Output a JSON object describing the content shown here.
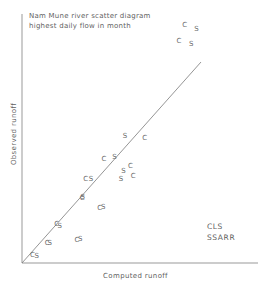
{
  "chart_data": {
    "type": "scatter",
    "title": "Nam Mune river scatter diagram",
    "subtitle": "highest daily flow in month",
    "xlabel": "Computed runoff",
    "ylabel": "Observed runoff",
    "grid": false,
    "xlim": [
      0,
      1
    ],
    "ylim": [
      0,
      1
    ],
    "axis_ticks": "none",
    "reference_line": {
      "label": "1:1 line",
      "from": [
        0,
        0
      ],
      "to": [
        0.74,
        0.84
      ]
    },
    "legend": {
      "position": "bottom-right",
      "entries": [
        "CLS",
        "SSARR"
      ]
    },
    "series": [
      {
        "name": "CLS",
        "marker_glyph": "C",
        "points": [
          [
            0.045,
            0.033
          ],
          [
            0.107,
            0.08
          ],
          [
            0.147,
            0.155
          ],
          [
            0.233,
            0.092
          ],
          [
            0.255,
            0.262
          ],
          [
            0.27,
            0.338
          ],
          [
            0.33,
            0.222
          ],
          [
            0.348,
            0.416
          ],
          [
            0.46,
            0.39
          ],
          [
            0.472,
            0.349
          ],
          [
            0.52,
            0.503
          ],
          [
            0.69,
            0.955
          ],
          [
            0.665,
            0.89
          ]
        ]
      },
      {
        "name": "SSARR",
        "marker_glyph": "S",
        "points": [
          [
            0.063,
            0.03
          ],
          [
            0.118,
            0.082
          ],
          [
            0.16,
            0.148
          ],
          [
            0.247,
            0.098
          ],
          [
            0.258,
            0.266
          ],
          [
            0.293,
            0.337
          ],
          [
            0.345,
            0.224
          ],
          [
            0.392,
            0.424
          ],
          [
            0.42,
            0.338
          ],
          [
            0.437,
            0.51
          ],
          [
            0.43,
            0.37
          ],
          [
            0.74,
            0.94
          ],
          [
            0.718,
            0.88
          ]
        ]
      }
    ]
  },
  "plot_geometry": {
    "origin_x": 22,
    "origin_y": 263,
    "x_axis_end": 258,
    "y_axis_top": 14,
    "line_end_x": 201,
    "line_end_y": 62
  }
}
